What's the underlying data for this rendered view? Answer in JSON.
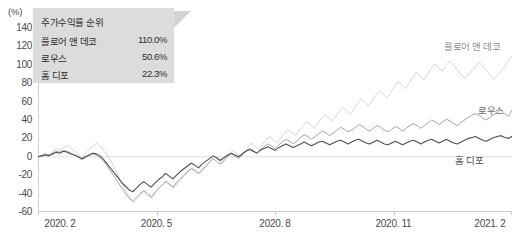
{
  "chart_data": {
    "type": "line",
    "title": "",
    "xlabel": "",
    "ylabel": "(%)",
    "yunit": "(%)",
    "ylim": [
      -60,
      140
    ],
    "ytick_labels": [
      "140",
      "120",
      "100",
      "80",
      "60",
      "40",
      "20",
      "0",
      "-20",
      "-40",
      "-60"
    ],
    "ytick_values": [
      140,
      120,
      100,
      80,
      60,
      40,
      20,
      0,
      -20,
      -40,
      -60
    ],
    "xtick_labels": [
      "2020. 2",
      "2020. 5",
      "2020. 8",
      "2020. 11",
      "2021. 2"
    ],
    "grid": false,
    "legend_position": "top-left-callout",
    "zero_line": true,
    "series": [
      {
        "name": "플로어 앤 데코",
        "final_value": 110.0,
        "color": "#cfcfcf",
        "values": [
          0,
          2,
          4,
          1,
          6,
          9,
          7,
          10,
          12,
          9,
          6,
          3,
          -2,
          4,
          8,
          12,
          15,
          11,
          6,
          1,
          -6,
          -14,
          -22,
          -30,
          -38,
          -44,
          -50,
          -46,
          -41,
          -36,
          -40,
          -44,
          -38,
          -33,
          -30,
          -26,
          -30,
          -34,
          -29,
          -24,
          -20,
          -16,
          -12,
          -15,
          -19,
          -14,
          -9,
          -4,
          1,
          -3,
          -8,
          -3,
          2,
          7,
          4,
          0,
          5,
          10,
          15,
          12,
          8,
          13,
          18,
          22,
          19,
          15,
          20,
          25,
          30,
          27,
          23,
          28,
          33,
          38,
          35,
          31,
          36,
          41,
          46,
          43,
          39,
          44,
          49,
          54,
          50,
          46,
          52,
          58,
          63,
          59,
          55,
          61,
          67,
          72,
          68,
          64,
          70,
          76,
          82,
          78,
          74,
          80,
          86,
          92,
          88,
          84,
          90,
          96,
          101,
          97,
          93,
          99,
          104,
          100,
          95,
          90,
          85,
          88,
          93,
          98,
          103,
          99,
          94,
          89,
          84,
          88,
          93,
          98,
          104,
          110
        ]
      },
      {
        "name": "로우스",
        "final_value": 50.6,
        "color": "#9a9a9a",
        "values": [
          0,
          1,
          3,
          2,
          4,
          6,
          5,
          7,
          6,
          4,
          2,
          0,
          -3,
          -1,
          1,
          3,
          2,
          -1,
          -5,
          -10,
          -16,
          -22,
          -28,
          -34,
          -40,
          -45,
          -48,
          -44,
          -40,
          -37,
          -41,
          -44,
          -39,
          -35,
          -31,
          -27,
          -30,
          -33,
          -28,
          -24,
          -20,
          -16,
          -13,
          -15,
          -18,
          -14,
          -10,
          -6,
          -2,
          -5,
          -8,
          -4,
          0,
          3,
          1,
          -2,
          2,
          6,
          9,
          7,
          4,
          8,
          11,
          14,
          12,
          9,
          13,
          16,
          19,
          17,
          14,
          17,
          21,
          24,
          22,
          19,
          22,
          25,
          28,
          26,
          23,
          26,
          29,
          32,
          30,
          27,
          29,
          32,
          35,
          33,
          30,
          28,
          31,
          34,
          32,
          29,
          27,
          30,
          33,
          31,
          28,
          31,
          34,
          36,
          34,
          31,
          34,
          37,
          40,
          38,
          35,
          38,
          41,
          39,
          36,
          34,
          37,
          40,
          43,
          45,
          47,
          45,
          42,
          40,
          43,
          46,
          48,
          51,
          47,
          44,
          50.6
        ]
      },
      {
        "name": "홈 디포",
        "final_value": 22.3,
        "color": "#4f4f4f",
        "values": [
          0,
          1,
          2,
          1,
          3,
          5,
          4,
          6,
          5,
          3,
          2,
          0,
          -2,
          0,
          2,
          4,
          3,
          1,
          -3,
          -8,
          -13,
          -18,
          -23,
          -28,
          -32,
          -36,
          -38,
          -34,
          -30,
          -27,
          -30,
          -33,
          -29,
          -25,
          -22,
          -18,
          -21,
          -24,
          -20,
          -16,
          -13,
          -10,
          -7,
          -9,
          -12,
          -8,
          -5,
          -2,
          1,
          -1,
          -4,
          -1,
          2,
          4,
          2,
          0,
          3,
          6,
          8,
          6,
          4,
          7,
          9,
          11,
          9,
          7,
          10,
          12,
          14,
          12,
          10,
          12,
          14,
          16,
          14,
          12,
          14,
          16,
          17,
          15,
          13,
          15,
          17,
          18,
          16,
          14,
          16,
          18,
          19,
          17,
          15,
          14,
          16,
          18,
          16,
          14,
          13,
          15,
          17,
          15,
          13,
          15,
          17,
          18,
          16,
          14,
          16,
          18,
          19,
          17,
          15,
          17,
          19,
          17,
          15,
          14,
          16,
          18,
          20,
          21,
          22,
          20,
          18,
          17,
          19,
          21,
          22,
          23,
          21,
          20,
          22.3
        ]
      }
    ]
  },
  "legend": {
    "title": "주가수익률 순위",
    "rows": [
      {
        "name": "플로어 앤 데코",
        "value": "110.0%"
      },
      {
        "name": "로우스",
        "value": "50.6%"
      },
      {
        "name": "홈 디포",
        "value": "22.3%"
      }
    ]
  },
  "series_labels": [
    {
      "text": "플로어 앤 데코",
      "color": "#8f8f8f"
    },
    {
      "text": "로우스",
      "color": "#6e6e6e"
    },
    {
      "text": "홈 디포",
      "color": "#4a4a4a"
    }
  ]
}
